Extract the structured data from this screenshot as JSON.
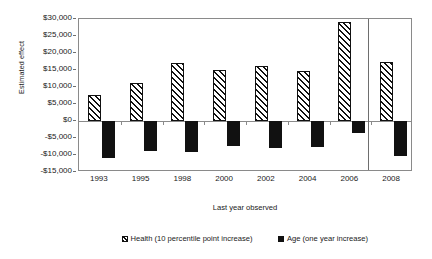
{
  "chart_data": {
    "type": "bar",
    "title": "",
    "xlabel": "Last year observed",
    "ylabel": "Estimated effect",
    "categories": [
      "1993",
      "1995",
      "1998",
      "2000",
      "2002",
      "2004",
      "2006",
      "2008"
    ],
    "series": [
      {
        "name": "Health (10 percentile point increase)",
        "pattern": "diagonal-hatch",
        "color": "#111111",
        "values": [
          7650,
          11200,
          17000,
          15000,
          16300,
          14700,
          29000,
          17500
        ]
      },
      {
        "name": "Age (one year increase)",
        "pattern": "solid",
        "color": "#111111",
        "values": [
          -10750,
          -8800,
          -9200,
          -7400,
          -8000,
          -7700,
          -3600,
          -10400
        ]
      }
    ],
    "ylim": [
      -15000,
      30000
    ],
    "ytick_values": [
      30000,
      25000,
      20000,
      15000,
      10000,
      5000,
      0,
      -5000,
      -10000,
      -15000
    ],
    "ytick_labels": [
      "$30,000",
      "$25,000",
      "$20,000",
      "$15,000",
      "$10,000",
      "$5,000",
      "$0",
      "-$5,000",
      "-$10,000",
      "-$15,000"
    ],
    "grid": false,
    "legend_position": "bottom",
    "annotations": [
      {
        "kind": "vertical-separator",
        "note": "divider drawn between the 2006 group and the 2008 group"
      }
    ]
  },
  "axis": {
    "y_title": "Estimated effect",
    "x_title": "Last year observed"
  },
  "legend": {
    "items": [
      {
        "label": "Health (10 percentile point increase)"
      },
      {
        "label": "Age (one year increase)"
      }
    ]
  }
}
